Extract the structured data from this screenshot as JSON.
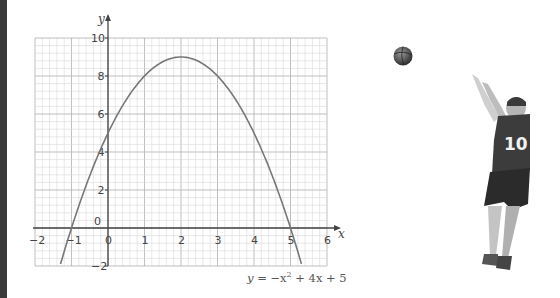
{
  "chart_data": {
    "type": "line",
    "title": "",
    "equation": "y = −x² + 4x + 5",
    "xlabel": "x",
    "ylabel": "y",
    "xlim": [
      -2,
      6
    ],
    "ylim": [
      -2,
      10
    ],
    "grid": true,
    "minor_grid_step": 0.2,
    "x_ticks": [
      -2,
      -1,
      0,
      1,
      2,
      3,
      4,
      5,
      6
    ],
    "y_ticks": [
      -2,
      0,
      2,
      4,
      6,
      8,
      10
    ],
    "series": [
      {
        "name": "y = −x² + 4x + 5",
        "x": [
          -1.3,
          -1,
          -0.5,
          0,
          0.5,
          1,
          1.5,
          2,
          2.5,
          3,
          3.5,
          4,
          4.5,
          5,
          5.3
        ],
        "y": [
          -1.89,
          0,
          2.75,
          5,
          6.75,
          8,
          8.75,
          9,
          8.75,
          8,
          6.75,
          5,
          2.75,
          0,
          -1.89
        ]
      }
    ],
    "key_points": {
      "vertex": [
        2,
        9
      ],
      "y_intercept": [
        0,
        5
      ],
      "roots": [
        -1,
        5
      ]
    }
  },
  "labels": {
    "x_axis": "x",
    "y_axis": "y",
    "equation_prefix": "y",
    "equation_rest": " = −x",
    "equation_exp": "2",
    "equation_tail": " + 4x + 5",
    "x_tick_labels": [
      "−2",
      "−1",
      "0",
      "1",
      "2",
      "3",
      "4",
      "5",
      "6"
    ],
    "y_tick_labels": [
      "−2",
      "0",
      "2",
      "4",
      "6",
      "8",
      "10"
    ]
  },
  "illustration": {
    "subject": "basketball player shooting",
    "jersey_number": "10"
  },
  "colors": {
    "grid_minor": "#d8d8d8",
    "grid_major": "#b8b8b8",
    "axis": "#444444",
    "curve": "#777777",
    "left_band": "#3a3a3a"
  }
}
